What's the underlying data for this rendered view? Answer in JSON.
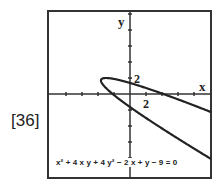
{
  "problem_label": "[36]",
  "graph": {
    "x_axis_label": "x",
    "y_axis_label": "y",
    "x_tick_label": "2",
    "y_tick_label": "2",
    "equation": "x² + 4 x y + 4 y² − 2 x + y − 9 = 0",
    "colors": {
      "curve": "#222222",
      "frame": "#333333",
      "axes": "#333333"
    }
  },
  "chart_data": {
    "type": "line",
    "title": "",
    "equation": "x^2 + 4xy + 4y^2 - 2x + y - 9 = 0",
    "curve_type": "parabola (implicit)",
    "xlabel": "x",
    "ylabel": "y",
    "xlim": [
      -10.25,
      10.125
    ],
    "ylim": [
      -10.5,
      10.4
    ],
    "tick_spacing": 2,
    "labeled_ticks": {
      "x": [
        2
      ],
      "y": [
        2
      ]
    },
    "key_points": {
      "y_intercepts": [
        1.38,
        -1.63
      ],
      "x_intercepts": [
        -2.16,
        4.16
      ],
      "leftmost_point": [
        -3.625,
        -1.61
      ]
    },
    "grid": false,
    "legend": null
  }
}
